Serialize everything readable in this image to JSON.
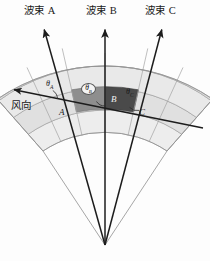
{
  "figure": {
    "background_color": "#fdfdfd",
    "width": 210,
    "height": 261
  },
  "beams": [
    {
      "id": "beam-a",
      "label": "波束 A",
      "label_x": 24,
      "label_y": 9,
      "tip_x": 43,
      "tip_y": 27,
      "apex_x": 105,
      "apex_y": 245,
      "cell_letter": "A",
      "cell_letter_x": 60,
      "cell_letter_y": 110,
      "angle_label": "θ",
      "angle_sub": "A",
      "angle_x": 47,
      "angle_y": 83,
      "color": "#1c1c1c"
    },
    {
      "id": "beam-b",
      "label": "波束 B",
      "label_x": 86,
      "label_y": 9,
      "tip_x": 105,
      "tip_y": 27,
      "apex_x": 105,
      "apex_y": 245,
      "cell_letter": "B",
      "cell_letter_x": 112,
      "cell_letter_y": 99,
      "angle_label": "θ",
      "angle_sub": "B",
      "angle_x": 86,
      "angle_y": 87,
      "color": "#1c1c1c"
    },
    {
      "id": "beam-c",
      "label": "波束 C",
      "label_x": 146,
      "label_y": 9,
      "tip_x": 163,
      "tip_y": 27,
      "apex_x": 105,
      "apex_y": 245,
      "cell_letter": "C",
      "cell_letter_x": 140,
      "cell_letter_y": 110,
      "angle_label": "θ",
      "angle_sub": "C",
      "angle_x": 126,
      "angle_y": 90,
      "color": "#1c1c1c"
    }
  ],
  "wind": {
    "id": "wind-arrow",
    "label": "风向",
    "label_x": 12,
    "label_y": 106,
    "from_x": 203,
    "from_y": 128,
    "to_x": 11,
    "to_y": 89,
    "color": "#1c1c1c"
  },
  "sector": {
    "apex_x": 105,
    "apex_y": 245,
    "inner_radius": 112,
    "outer_radius": 192,
    "start_angle_deg": -123,
    "end_angle_deg": -57,
    "band_count": 3,
    "radial_division_count": 6,
    "fill_light": "#e3e3e3",
    "fill_mid": "#d6d6d6",
    "fill_pale": "#eeeeee",
    "highlight_mid": "#8c8c8c",
    "highlight_dark": "#4a4a4a",
    "stroke": "#9a9a9a",
    "stroke_width": 0.7
  },
  "legend_note": ""
}
